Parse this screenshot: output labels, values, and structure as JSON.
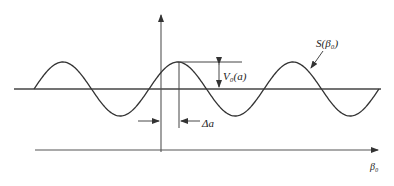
{
  "diagram": {
    "labels": {
      "signal": "S(β₀)",
      "amplitude": "V₀(a)",
      "offset": "Δa",
      "x_axis": "β₀"
    },
    "colors": {
      "stroke": "#333333",
      "background": "#ffffff"
    },
    "waveform": {
      "type": "sine",
      "start_x": 34,
      "end_x": 379,
      "baseline_y": 89,
      "amplitude_px": 27,
      "period_px": 115,
      "cycles": 3
    }
  }
}
